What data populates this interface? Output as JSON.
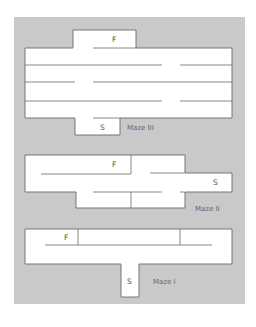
{
  "figure": {
    "background_color": "#c9c9c9",
    "path_color": "#ffffff",
    "wall_color": "#6a6a6a",
    "mazes": [
      {
        "name": "Maze III",
        "start_label": "S",
        "finish_label": "F"
      },
      {
        "name": "Maze II",
        "start_label": "S",
        "finish_label": "F"
      },
      {
        "name": "Maze I",
        "start_label": "S",
        "finish_label": "F"
      }
    ]
  }
}
